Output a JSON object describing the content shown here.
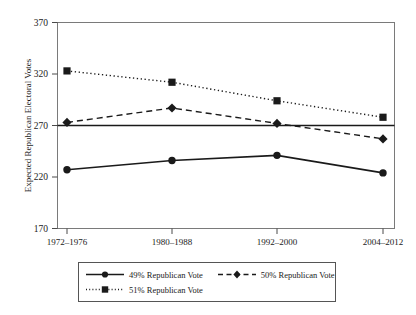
{
  "chart_data": {
    "type": "line",
    "title": "",
    "subtitle": "",
    "xlabel": "",
    "ylabel": "Expected Republican Electoral Votes",
    "categories": [
      "1972–1976",
      "1980–1988",
      "1992–2000",
      "2004–2012"
    ],
    "ylim": [
      170,
      370
    ],
    "yticks": [
      170,
      220,
      270,
      320,
      370
    ],
    "ytick_labels": [
      "170",
      "220",
      "270",
      "320",
      "370"
    ],
    "grid": false,
    "legend_position": "bottom",
    "reference_line": {
      "value": 270,
      "label": "",
      "style": "solid"
    },
    "series": [
      {
        "name": "49% Republican Vote",
        "values": [
          227,
          236,
          241,
          224
        ],
        "line_style": "solid",
        "marker": "circle",
        "color": "#1a1a1a"
      },
      {
        "name": "50% Republican Vote",
        "values": [
          273,
          287,
          272,
          257
        ],
        "line_style": "dashed",
        "marker": "diamond",
        "color": "#1a1a1a"
      },
      {
        "name": "51% Republican Vote",
        "values": [
          323,
          312,
          294,
          278
        ],
        "line_style": "dotted",
        "marker": "square",
        "color": "#1a1a1a"
      }
    ]
  },
  "axes": {
    "y_axis_title": "Expected Republican Electoral Votes",
    "tick_170": "170",
    "tick_220": "220",
    "tick_270": "270",
    "tick_320": "320",
    "tick_370": "370",
    "cat_1": "1972–1976",
    "cat_2": "1980–1988",
    "cat_3": "1992–2000",
    "cat_4": "2004–2012"
  },
  "legend": {
    "items": [
      {
        "label": "49% Republican Vote",
        "style": "solid",
        "marker": "circle"
      },
      {
        "label": "50% Republican Vote",
        "style": "dashed",
        "marker": "diamond"
      },
      {
        "label": "51% Republican Vote",
        "style": "dotted",
        "marker": "square"
      }
    ]
  },
  "colors": {
    "ink": "#1a1a1a",
    "frame": "#6e6e6e",
    "background": "#ffffff"
  }
}
